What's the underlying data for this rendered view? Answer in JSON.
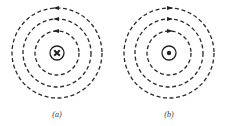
{
  "figure": {
    "background": "#ffffff",
    "ink_color": "#222222",
    "panels": [
      {
        "id": "a",
        "label": "(a)",
        "center": [
          57,
          53
        ],
        "wire_radius": 7,
        "wire_symbol": "cross",
        "wire_meaning": "current into page",
        "field_rings": [
          {
            "radius": 22,
            "arrow_direction": "left"
          },
          {
            "radius": 34,
            "arrow_direction": "left"
          },
          {
            "radius": 45,
            "arrow_direction": "left"
          }
        ],
        "circulation": "counterclockwise"
      },
      {
        "id": "b",
        "label": "(b)",
        "center": [
          169,
          53
        ],
        "wire_radius": 7,
        "wire_symbol": "dot",
        "wire_meaning": "current out of page",
        "field_rings": [
          {
            "radius": 22,
            "arrow_direction": "right"
          },
          {
            "radius": 34,
            "arrow_direction": "right"
          },
          {
            "radius": 45,
            "arrow_direction": "right"
          }
        ],
        "circulation": "clockwise"
      }
    ]
  }
}
